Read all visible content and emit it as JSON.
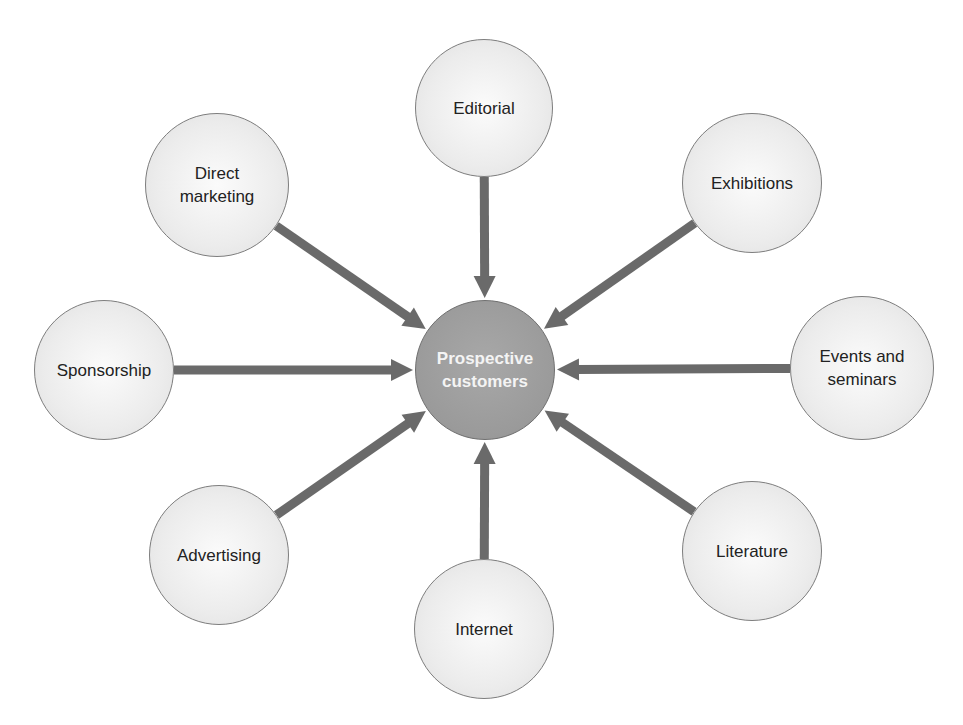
{
  "diagram": {
    "title": "",
    "center": {
      "label": "Prospective\ncustomers",
      "x": 485,
      "y": 370,
      "r": 70,
      "fill": "#9c9c9c"
    },
    "arrow_color": "#6a6a6a",
    "nodes": [
      {
        "id": "editorial",
        "label": "Editorial",
        "x": 484,
        "y": 108,
        "r": 69
      },
      {
        "id": "exhibitions",
        "label": "Exhibitions",
        "x": 752,
        "y": 183,
        "r": 70
      },
      {
        "id": "events-and-seminars",
        "label": "Events and\nseminars",
        "x": 862,
        "y": 368,
        "r": 72
      },
      {
        "id": "literature",
        "label": "Literature",
        "x": 752,
        "y": 551,
        "r": 70
      },
      {
        "id": "internet",
        "label": "Internet",
        "x": 484,
        "y": 629,
        "r": 70
      },
      {
        "id": "advertising",
        "label": "Advertising",
        "x": 219,
        "y": 555,
        "r": 70
      },
      {
        "id": "sponsorship",
        "label": "Sponsorship",
        "x": 104,
        "y": 370,
        "r": 70
      },
      {
        "id": "direct-marketing",
        "label": "Direct\nmarketing",
        "x": 217,
        "y": 185,
        "r": 72
      }
    ],
    "edges": [
      {
        "from": "editorial",
        "to": "center"
      },
      {
        "from": "exhibitions",
        "to": "center"
      },
      {
        "from": "events-and-seminars",
        "to": "center"
      },
      {
        "from": "literature",
        "to": "center"
      },
      {
        "from": "internet",
        "to": "center"
      },
      {
        "from": "advertising",
        "to": "center"
      },
      {
        "from": "sponsorship",
        "to": "center"
      },
      {
        "from": "direct-marketing",
        "to": "center"
      }
    ]
  }
}
